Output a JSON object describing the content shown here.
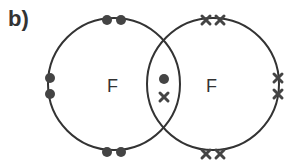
{
  "diagram": {
    "part_label": "b)",
    "type": "dot-and-cross diagram",
    "atoms": [
      {
        "symbol": "F",
        "electron_marker": "dot",
        "center": [
          114,
          84
        ],
        "radius": 66
      },
      {
        "symbol": "F",
        "electron_marker": "cross",
        "center": [
          213,
          84
        ],
        "radius": 66
      }
    ],
    "colors": {
      "line": "#333333",
      "marker": "#444444",
      "text": "#333333"
    },
    "shared_pair": {
      "dot": [
        164,
        79
      ],
      "cross": [
        164,
        97
      ]
    },
    "left_lone_pairs": [
      [
        [
          107,
          20
        ],
        [
          121,
          20
        ]
      ],
      [
        [
          50,
          78
        ],
        [
          50,
          94
        ]
      ],
      [
        [
          107,
          152
        ],
        [
          121,
          152
        ]
      ]
    ],
    "right_lone_pairs": [
      [
        [
          206,
          20
        ],
        [
          220,
          20
        ]
      ],
      [
        [
          278,
          78
        ],
        [
          278,
          94
        ]
      ],
      [
        [
          206,
          154
        ],
        [
          220,
          154
        ]
      ]
    ]
  }
}
